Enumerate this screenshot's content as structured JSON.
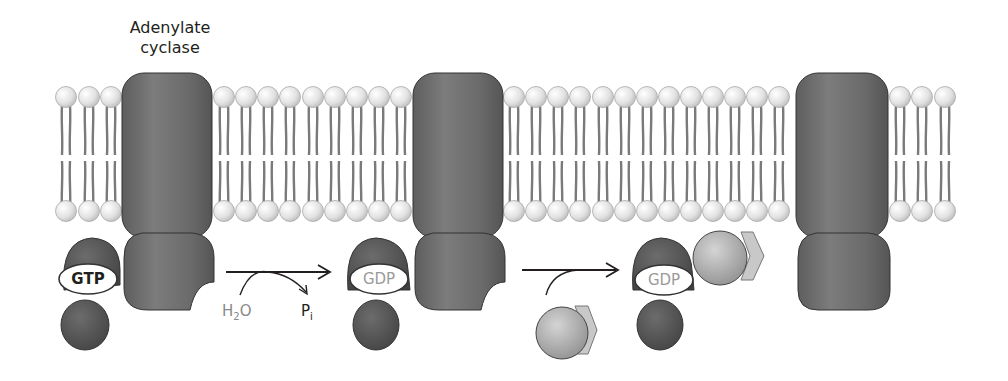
{
  "diagram": {
    "title_label": {
      "line1": "Adenylate",
      "line2": "cyclase"
    },
    "stages": [
      {
        "g_alpha_nucleotide": "GTP",
        "nucleotide_color": "#231f20"
      },
      {
        "g_alpha_nucleotide": "GDP",
        "nucleotide_color": "#9a9a9a"
      },
      {
        "g_alpha_nucleotide": "GDP",
        "nucleotide_color": "#9a9a9a"
      }
    ],
    "reaction_1": {
      "input": "H2O",
      "input_main": "H",
      "input_sub": "2",
      "input_tail": "O",
      "output": "Pi",
      "output_main": "P",
      "output_sub": "i"
    },
    "reaction_2": {
      "input": "G beta-gamma subunit"
    },
    "colors": {
      "protein": "#6f6f6f",
      "protein_dark": "#4a4a4a",
      "lipid_head": "#e6e6e6",
      "lipid_tail": "#777777",
      "beta_gamma": "#b5b5b5",
      "gamma_chevron": "#c8c8c8",
      "arrow": "#231f20"
    }
  }
}
